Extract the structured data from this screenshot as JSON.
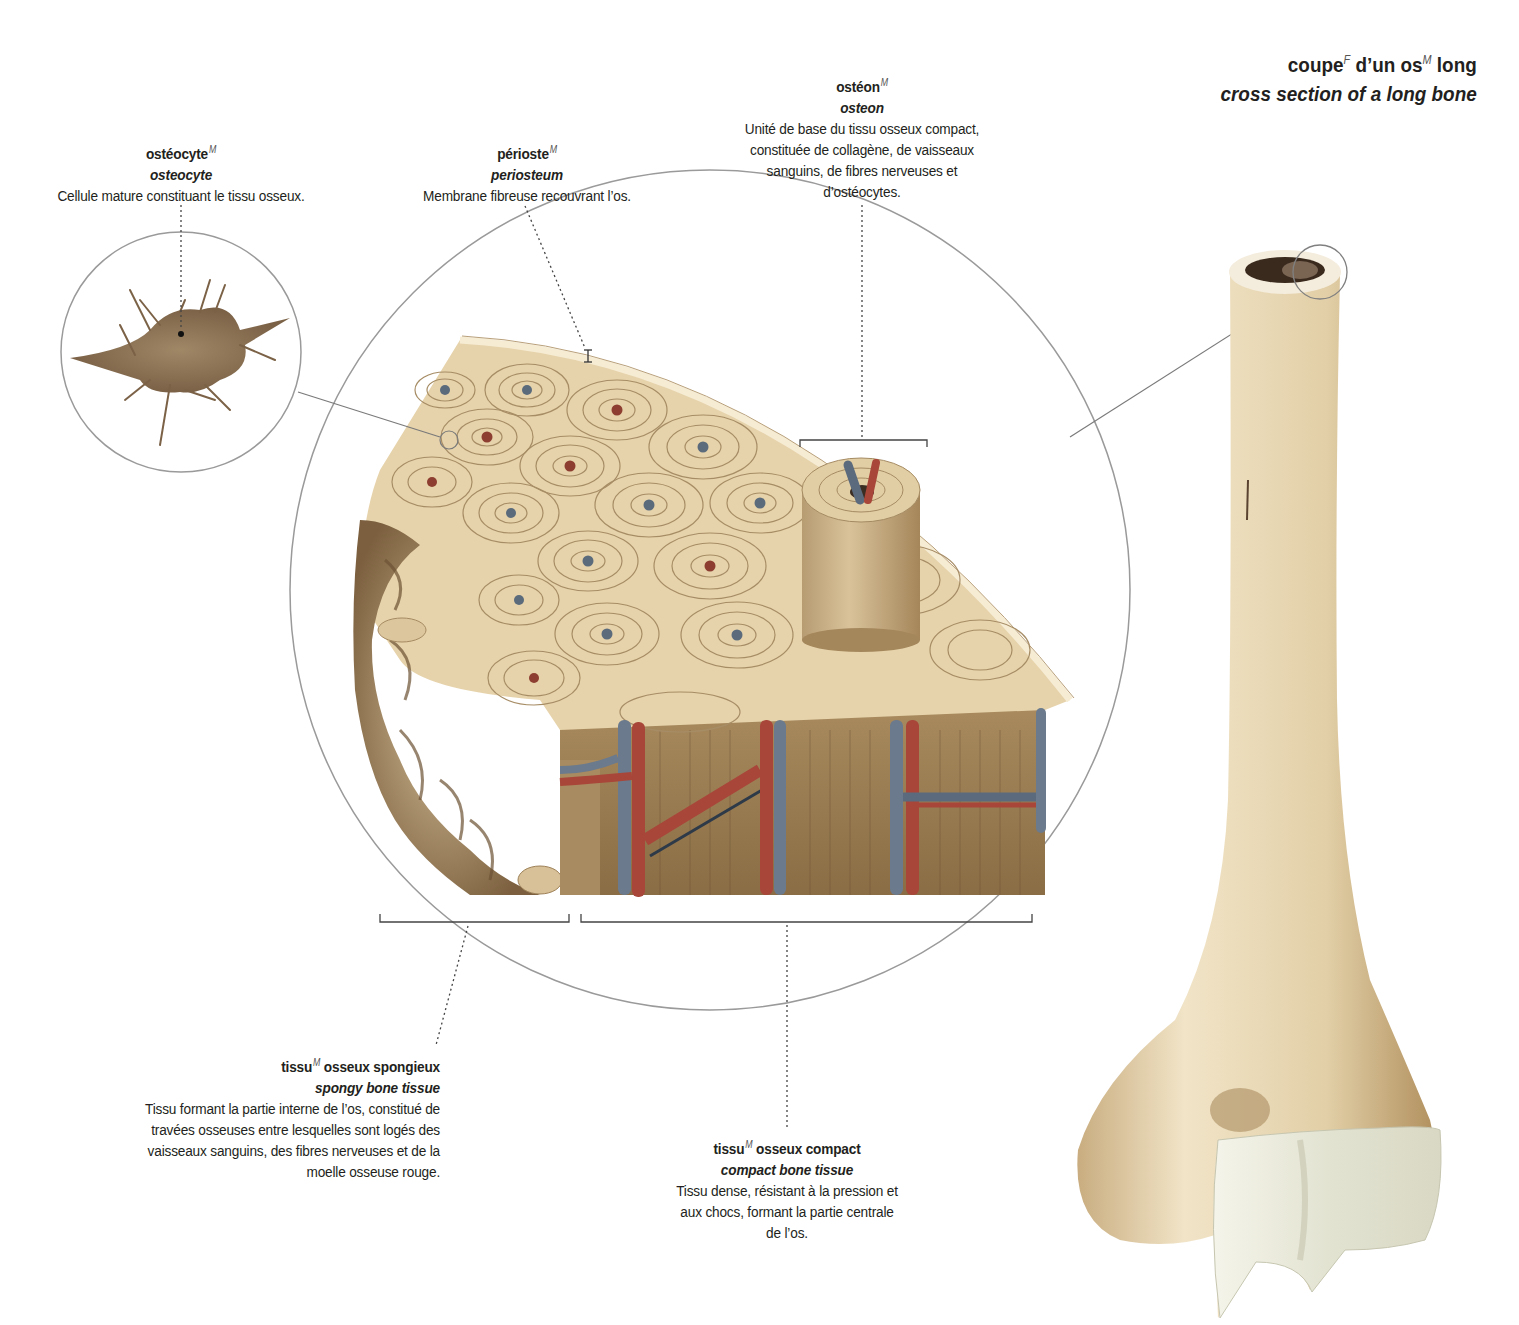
{
  "title": {
    "fr_parts": [
      "coupe",
      "F",
      " d’un os",
      "M",
      " long"
    ],
    "en": "cross section of a long bone"
  },
  "labels": {
    "osteocyte": {
      "term": "ostéocyte",
      "gender": "M",
      "en": "osteocyte",
      "definition": [
        "Cellule mature constituant le tissu osseux."
      ]
    },
    "periosteum": {
      "term": "périoste",
      "gender": "M",
      "en": "periosteum",
      "definition": [
        "Membrane fibreuse recouvrant l’os."
      ]
    },
    "osteon": {
      "term": "ostéon",
      "gender": "M",
      "en": "osteon",
      "definition": [
        "Unité de base du tissu osseux compact,",
        "constituée de collagène, de vaisseaux",
        "sanguins, de fibres nerveuses et",
        "d’ostéocytes."
      ]
    },
    "spongy": {
      "term": "tissu",
      "gender": "M",
      "term_rest": " osseux spongieux",
      "en": "spongy bone tissue",
      "definition": [
        "Tissu formant la partie interne de l’os, constitué de",
        "travées osseuses entre lesquelles sont logés des",
        "vaisseaux sanguins, des fibres nerveuses et de la",
        "moelle osseuse rouge."
      ]
    },
    "compact": {
      "term": "tissu",
      "gender": "M",
      "term_rest": " osseux compact",
      "en": "compact bone tissue",
      "definition": [
        "Tissu dense, résistant à la pression et",
        "aux chocs, formant la partie centrale",
        "de l’os."
      ]
    }
  },
  "colors": {
    "bone_light": "#e8d5ad",
    "bone_mid": "#c8ab7b",
    "bone_dark": "#8c6c45",
    "compact_side": "#9c7f55",
    "artery": "#a8463a",
    "vein": "#6b7a8c",
    "leader_line": "#8a8a8a",
    "circle_stroke": "#9a9a9a",
    "cartilage": "#ecece0"
  }
}
